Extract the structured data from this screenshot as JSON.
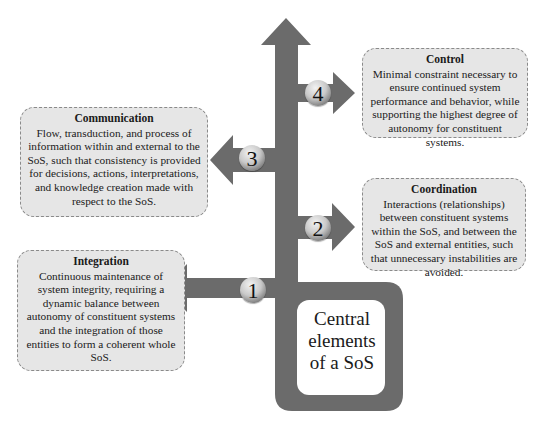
{
  "diagram": {
    "center": {
      "label_lines": [
        "Central",
        "elements",
        "of a SoS"
      ],
      "label": "Central elements of a SoS"
    },
    "colors": {
      "arrow": "#6b6b6b",
      "box_fill": "#e6e6e6",
      "box_border": "#8a8a8a",
      "center_fill": "#ffffff"
    },
    "elements": [
      {
        "number": "1",
        "title": "Integration",
        "description": "Continuous maintenance of system integrity, requiring a dynamic balance between autonomy of constituent systems and the integration of those entities to form a coherent whole SoS.",
        "direction": "left"
      },
      {
        "number": "2",
        "title": "Coordination",
        "description": "Interactions (relationships) between constituent systems within the SoS, and between the SoS and external entities, such that unnecessary instabilities are avoided.",
        "direction": "right"
      },
      {
        "number": "3",
        "title": "Communication",
        "description": "Flow, transduction, and process of information within and external to the SoS, such that consistency is provided for decisions, actions, interpretations, and knowledge creation made with respect to the SoS.",
        "direction": "left"
      },
      {
        "number": "4",
        "title": "Control",
        "description": "Minimal constraint necessary to ensure continued system performance and behavior, while supporting the highest degree of autonomy for constituent systems.",
        "direction": "right"
      }
    ]
  }
}
